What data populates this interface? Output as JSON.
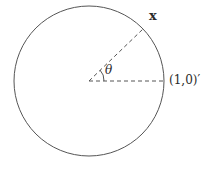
{
  "diagram": {
    "type": "unit-circle-angle",
    "circle": {
      "cx": 89,
      "cy": 81,
      "r": 75,
      "stroke": "#555555"
    },
    "center": {
      "x": 89,
      "y": 81
    },
    "reference_point": {
      "x": 164,
      "y": 81
    },
    "vector_point": {
      "x": 143,
      "y": 29
    },
    "dash_color": "#555555",
    "labels": {
      "vector": "x",
      "angle": "θ",
      "reference": "(1,0)′"
    }
  }
}
